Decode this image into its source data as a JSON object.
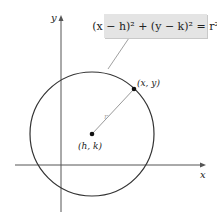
{
  "diagram": {
    "axes": {
      "x_label": "x",
      "y_label": "y"
    },
    "equation": "(x − h)² + (y − k)² = r²",
    "center_label": "(h, k)",
    "point_label": "(x, y)",
    "radius_label": "r",
    "colors": {
      "circle": "#333333",
      "radius_line": "#999999",
      "box": "#e4e4e4",
      "axes": "#555555"
    }
  }
}
